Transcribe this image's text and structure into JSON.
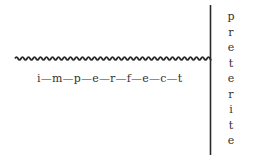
{
  "diagram": {
    "title": "",
    "imperfect": {
      "label": "i—m—p—e—r—f—e—c—t",
      "word": "imperfect",
      "line_style": "wavy",
      "orientation": "horizontal"
    },
    "preterite": {
      "word": "preterite",
      "letters": [
        "p",
        "r",
        "e",
        "t",
        "e",
        "r",
        "i",
        "t",
        "e"
      ],
      "line_style": "solid",
      "orientation": "vertical"
    },
    "colors": {
      "ink": "#2a2a2a",
      "background": "#ffffff"
    }
  }
}
